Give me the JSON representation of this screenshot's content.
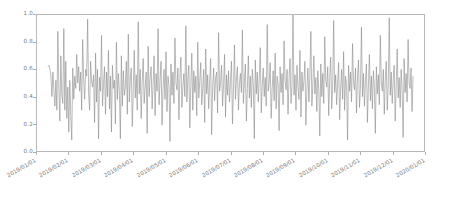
{
  "chart_data": {
    "type": "line",
    "title": "",
    "xlabel": "",
    "ylabel": "",
    "ylim": [
      0.0,
      1.0
    ],
    "xlim": [
      "2019/01/01",
      "2020/01/01"
    ],
    "grid": false,
    "legend": null,
    "line_color": "#8c8c8c",
    "line_width": 0.6,
    "y_ticks": [
      "1.0",
      "0.8",
      "0.6",
      "0.4",
      "0.2",
      "0.0"
    ],
    "y_tick_values": [
      1.0,
      0.8,
      0.6,
      0.4,
      0.2,
      0.0
    ],
    "x_ticks": [
      "2019/01/01",
      "2019/02/01",
      "2019/03/01",
      "2019/04/01",
      "2019/05/01",
      "2019/06/01",
      "2019/07/01",
      "2019/08/01",
      "2019/09/01",
      "2019/10/01",
      "2019/11/01",
      "2019/12/01",
      "2020/01/01"
    ],
    "series": [
      {
        "name": "series-1",
        "values": [
          0.62,
          0.63,
          0.6,
          0.55,
          0.4,
          0.58,
          0.44,
          0.33,
          0.52,
          0.3,
          0.88,
          0.47,
          0.22,
          0.7,
          0.41,
          0.35,
          0.9,
          0.3,
          0.66,
          0.24,
          0.47,
          0.14,
          0.52,
          0.26,
          0.08,
          0.61,
          0.38,
          0.55,
          0.46,
          0.71,
          0.5,
          0.62,
          0.44,
          0.58,
          0.3,
          0.82,
          0.53,
          0.38,
          0.6,
          0.55,
          0.97,
          0.42,
          0.3,
          0.66,
          0.51,
          0.47,
          0.56,
          0.21,
          0.72,
          0.36,
          0.6,
          0.09,
          0.54,
          0.44,
          0.85,
          0.33,
          0.49,
          0.62,
          0.27,
          0.58,
          0.4,
          0.74,
          0.31,
          0.55,
          0.14,
          0.63,
          0.46,
          0.52,
          0.2,
          0.8,
          0.38,
          0.57,
          0.44,
          0.09,
          0.7,
          0.33,
          0.59,
          0.41,
          0.47,
          0.66,
          0.27,
          0.86,
          0.36,
          0.53,
          0.61,
          0.18,
          0.45,
          0.74,
          0.39,
          0.56,
          0.3,
          0.95,
          0.42,
          0.6,
          0.24,
          0.51,
          0.68,
          0.35,
          0.47,
          0.58,
          0.13,
          0.77,
          0.4,
          0.54,
          0.62,
          0.31,
          0.49,
          0.7,
          0.26,
          0.57,
          0.44,
          0.9,
          0.34,
          0.52,
          0.66,
          0.19,
          0.46,
          0.6,
          0.38,
          0.73,
          0.29,
          0.55,
          0.48,
          0.07,
          0.64,
          0.41,
          0.58,
          0.35,
          0.83,
          0.5,
          0.45,
          0.61,
          0.23,
          0.54,
          0.69,
          0.32,
          0.47,
          0.57,
          0.4,
          0.92,
          0.36,
          0.53,
          0.63,
          0.17,
          0.48,
          0.72,
          0.3,
          0.59,
          0.43,
          0.55,
          0.26,
          0.8,
          0.39,
          0.51,
          0.65,
          0.34,
          0.46,
          0.6,
          0.21,
          0.75,
          0.42,
          0.56,
          0.31,
          0.52,
          0.68,
          0.12,
          0.47,
          0.61,
          0.37,
          0.54,
          0.58,
          0.28,
          0.87,
          0.44,
          0.5,
          0.63,
          0.33,
          0.48,
          0.71,
          0.25,
          0.56,
          0.41,
          0.59,
          0.36,
          0.52,
          0.66,
          0.2,
          0.45,
          0.78,
          0.38,
          0.53,
          0.62,
          0.3,
          0.49,
          0.57,
          0.43,
          0.89,
          0.35,
          0.51,
          0.64,
          0.22,
          0.46,
          0.7,
          0.39,
          0.55,
          0.32,
          0.6,
          0.48,
          0.09,
          0.67,
          0.42,
          0.58,
          0.36,
          0.53,
          0.76,
          0.28,
          0.47,
          0.61,
          0.4,
          0.54,
          0.33,
          0.93,
          0.44,
          0.5,
          0.65,
          0.24,
          0.46,
          0.59,
          0.37,
          0.72,
          0.31,
          0.55,
          0.49,
          0.15,
          0.62,
          0.43,
          0.57,
          0.34,
          0.81,
          0.52,
          0.45,
          0.6,
          0.27,
          0.53,
          0.68,
          0.35,
          0.48,
          1.0,
          0.41,
          0.56,
          0.3,
          0.63,
          0.47,
          0.38,
          0.74,
          0.25,
          0.58,
          0.44,
          0.51,
          0.66,
          0.19,
          0.46,
          0.61,
          0.36,
          0.55,
          0.88,
          0.33,
          0.49,
          0.7,
          0.42,
          0.54,
          0.29,
          0.59,
          0.45,
          0.11,
          0.64,
          0.4,
          0.57,
          0.35,
          0.84,
          0.52,
          0.47,
          0.62,
          0.26,
          0.53,
          0.69,
          0.31,
          0.48,
          0.96,
          0.43,
          0.56,
          0.34,
          0.51,
          0.65,
          0.23,
          0.46,
          0.6,
          0.38,
          0.73,
          0.3,
          0.55,
          0.49,
          0.08,
          0.63,
          0.44,
          0.58,
          0.36,
          0.79,
          0.5,
          0.45,
          0.61,
          0.28,
          0.54,
          0.67,
          0.32,
          0.47,
          0.91,
          0.4,
          0.57,
          0.33,
          0.52,
          0.64,
          0.21,
          0.48,
          0.71,
          0.37,
          0.55,
          0.31,
          0.59,
          0.46,
          0.13,
          0.62,
          0.42,
          0.56,
          0.34,
          0.85,
          0.51,
          0.44,
          0.6,
          0.27,
          0.53,
          0.66,
          0.3,
          0.49,
          0.98,
          0.41,
          0.58,
          0.35,
          0.52,
          0.63,
          0.22,
          0.47,
          0.75,
          0.39,
          0.54,
          0.32,
          0.6,
          0.45,
          0.1,
          0.68,
          0.43,
          0.57,
          0.36,
          0.82,
          0.5,
          0.46,
          0.61,
          0.29,
          0.55
        ]
      }
    ]
  }
}
